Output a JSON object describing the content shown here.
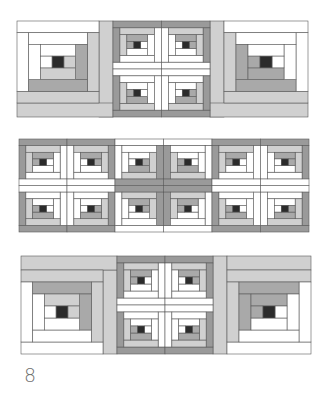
{
  "figure": {
    "label": "8"
  },
  "colors": {
    "white": "#ffffff",
    "light": "#d0d0d0",
    "mid": "#a9a9a9",
    "dark": "#9a9a9a",
    "center": "#2b2b2b",
    "stroke": "#5a5a5a"
  },
  "rows": [
    {
      "name": "row-1",
      "strips": [
        {
          "x": 99,
          "y": 21,
          "w": 14,
          "h": 96,
          "color": "light"
        },
        {
          "x": 210,
          "y": 21,
          "w": 14,
          "h": 96,
          "color": "light"
        }
      ],
      "blocks": [
        {
          "name": "large-block-top-left",
          "x": 17,
          "y": 21,
          "size": 82,
          "h": 82,
          "center": 14,
          "log": 14,
          "rings": 3,
          "darkSides": [
            "right",
            "bottom"
          ],
          "ringColors": [
            [
              "white",
              "light"
            ],
            [
              "white",
              "mid"
            ],
            [
              "white",
              "light"
            ]
          ],
          "extendBottom": {
            "y": 103,
            "h": 14,
            "w": 96,
            "color": "light"
          }
        },
        {
          "name": "large-block-top-right",
          "x": 224,
          "y": 21,
          "size": 84,
          "h": 82,
          "center": 14,
          "log": 14,
          "rings": 3,
          "darkSides": [
            "left",
            "bottom"
          ],
          "ringColors": [
            [
              "white",
              "light"
            ],
            [
              "white",
              "mid"
            ],
            [
              "white",
              "mid"
            ]
          ],
          "extendBottom": {
            "x": 210,
            "y": 103,
            "h": 14,
            "w": 98,
            "color": "light"
          }
        }
      ],
      "smallGroup": {
        "x": 113,
        "y": 21,
        "w": 97,
        "h": 96,
        "crossColor": "white",
        "orient": [
          "tl",
          "tr",
          "bl",
          "br"
        ],
        "type": "outer-dark"
      }
    },
    {
      "name": "row-2",
      "groups": [
        {
          "x": 19,
          "y": 139,
          "w": 96,
          "h": 93,
          "type": "outer-dark"
        },
        {
          "x": 115,
          "y": 139,
          "w": 97,
          "h": 93,
          "type": "inner-dark"
        },
        {
          "x": 212,
          "y": 139,
          "w": 97,
          "h": 93,
          "type": "outer-dark"
        }
      ]
    },
    {
      "name": "row-3",
      "strips": [
        {
          "x": 103,
          "y": 270,
          "w": 14,
          "h": 84,
          "color": "light"
        },
        {
          "x": 213,
          "y": 256,
          "w": 14,
          "h": 98,
          "color": "light"
        }
      ],
      "blocks": [
        {
          "name": "large-block-bottom-left",
          "x": 21,
          "y": 270,
          "size": 82,
          "h": 84,
          "center": 14,
          "log": 14,
          "rings": 3,
          "darkSides": [
            "top",
            "right"
          ],
          "ringColors": [
            [
              "white",
              "light"
            ],
            [
              "white",
              "mid"
            ],
            [
              "white",
              "light"
            ]
          ],
          "extendTop": {
            "x": 21,
            "y": 256,
            "h": 14,
            "w": 96,
            "color": "light"
          }
        },
        {
          "name": "large-block-bottom-right",
          "x": 227,
          "y": 270,
          "size": 84,
          "h": 84,
          "center": 14,
          "log": 14,
          "rings": 3,
          "darkSides": [
            "top",
            "left"
          ],
          "ringColors": [
            [
              "white",
              "light"
            ],
            [
              "white",
              "mid"
            ],
            [
              "white",
              "mid"
            ]
          ],
          "extendTop": {
            "x": 227,
            "y": 256,
            "h": 14,
            "w": 84,
            "color": "light"
          }
        }
      ],
      "smallGroup": {
        "x": 117,
        "y": 256,
        "w": 96,
        "h": 98,
        "type": "outer-dark"
      }
    }
  ]
}
